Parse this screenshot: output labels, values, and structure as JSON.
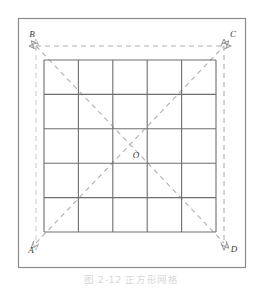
{
  "figure": {
    "caption": "图 2-12  正方形网格",
    "background_color": "#ffffff",
    "frame": {
      "name": "outer-frame",
      "x": 18.5,
      "y": 18.5,
      "width": 227,
      "height": 249,
      "stroke_color": "#8a8a8a",
      "stroke_width": 1.2,
      "fill": "#ffffff"
    },
    "grid": {
      "name": "square-grid",
      "x": 44,
      "y": 60,
      "size": 172,
      "rows": 5,
      "columns": 5,
      "cell_size": 34.4,
      "stroke_color": "#6e6e6e",
      "stroke_width": 1.1
    },
    "guides": {
      "stroke_color": "#b0b0b0",
      "faint_stroke_color": "#cfcfcf",
      "stroke_width": 1.1,
      "dash_pattern": "5 4",
      "lines": [
        {
          "name": "guide-top-BC",
          "from": "B",
          "to": "C",
          "x1": 36,
          "y1": 46,
          "x2": 224,
          "y2": 46,
          "arrows": "both",
          "faint": false
        },
        {
          "name": "guide-right-CD",
          "from": "C",
          "to": "D",
          "x1": 224,
          "y1": 46,
          "x2": 224,
          "y2": 243,
          "arrows": "both",
          "faint": false
        },
        {
          "name": "guide-left-BA",
          "from": "B",
          "to": "A",
          "x1": 36,
          "y1": 46,
          "x2": 36,
          "y2": 243,
          "arrows": "both",
          "faint": true
        },
        {
          "name": "diagonal-AC",
          "from": "A",
          "to": "C",
          "x1": 36,
          "y1": 243,
          "x2": 224,
          "y2": 46,
          "arrows": "both",
          "faint": false
        },
        {
          "name": "diagonal-BD",
          "from": "B",
          "to": "D",
          "x1": 36,
          "y1": 46,
          "x2": 224,
          "y2": 243,
          "arrows": "both",
          "faint": false
        }
      ]
    },
    "labels": [
      {
        "name": "vertex-label-B",
        "text": "B",
        "x": 32,
        "y": 37,
        "anchor": "middle"
      },
      {
        "name": "vertex-label-C",
        "text": "C",
        "x": 233,
        "y": 37,
        "anchor": "middle"
      },
      {
        "name": "vertex-label-A",
        "text": "A",
        "x": 31,
        "y": 253,
        "anchor": "middle"
      },
      {
        "name": "vertex-label-D",
        "text": "D",
        "x": 234,
        "y": 252,
        "anchor": "middle"
      },
      {
        "name": "vertex-label-O",
        "text": "O",
        "x": 136,
        "y": 158,
        "anchor": "middle"
      }
    ]
  }
}
